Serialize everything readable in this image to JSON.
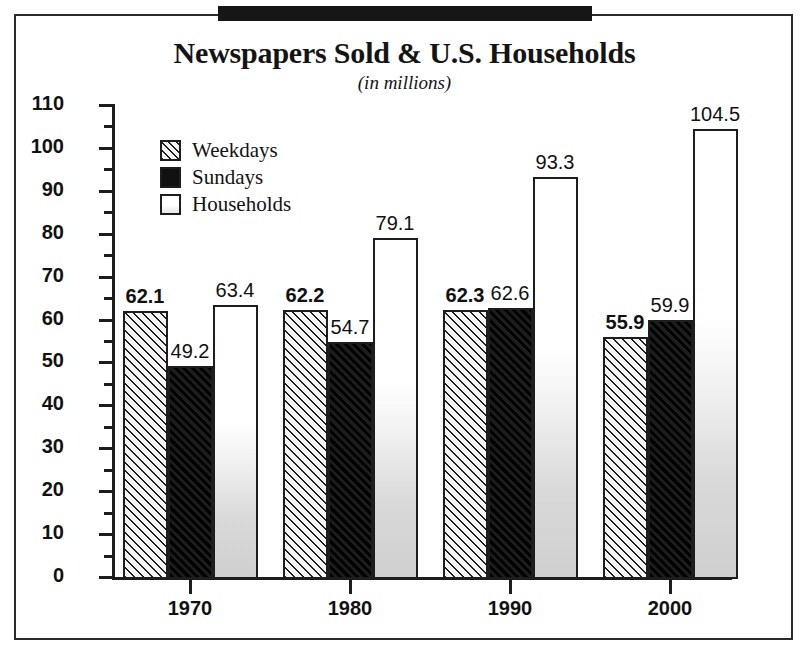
{
  "chart_data": {
    "type": "bar",
    "title": "Newspapers Sold & U.S. Households",
    "subtitle": "(in millions)",
    "xlabel": "",
    "ylabel": "",
    "ylim": [
      0,
      110
    ],
    "ytick_step": 10,
    "yminor_step": 5,
    "grid": false,
    "legend_position": "upper-left-inside",
    "categories": [
      "1970",
      "1980",
      "1990",
      "2000"
    ],
    "ytick_labels": [
      "0",
      "10",
      "20",
      "30",
      "40",
      "50",
      "60",
      "70",
      "80",
      "90",
      "100",
      "110"
    ],
    "series": [
      {
        "name": "Weekdays",
        "fill": "diagonal-hatch",
        "label_bold": true,
        "values": [
          62.1,
          62.2,
          62.3,
          55.9
        ],
        "value_labels": [
          "62.1",
          "62.2",
          "62.3",
          "55.9"
        ]
      },
      {
        "name": "Sundays",
        "fill": "solid-black",
        "label_bold": false,
        "values": [
          49.2,
          54.7,
          62.6,
          59.9
        ],
        "value_labels": [
          "49.2",
          "54.7",
          "62.6",
          "59.9"
        ]
      },
      {
        "name": "Households",
        "fill": "white-gradient",
        "label_bold": false,
        "values": [
          63.4,
          79.1,
          93.3,
          104.5
        ],
        "value_labels": [
          "63.4",
          "79.1",
          "93.3",
          "104.5"
        ]
      }
    ],
    "colors": {
      "axis": "#1d1d1d",
      "text": "#111111",
      "weekdays": "#f2f2f2",
      "sundays": "#131313",
      "households": "#ffffff",
      "top_bar": "#161616",
      "frame": "#2b2b2b"
    }
  }
}
